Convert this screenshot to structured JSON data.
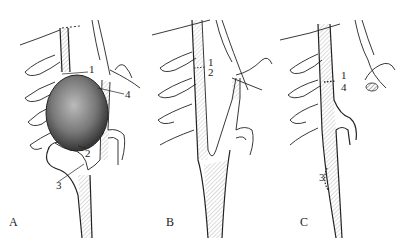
{
  "figure": {
    "panels": [
      {
        "id": "A",
        "label": "A",
        "numbers": [
          "1",
          "4",
          "2",
          "3"
        ]
      },
      {
        "id": "B",
        "label": "B",
        "numbers": [
          "1",
          "2"
        ]
      },
      {
        "id": "C",
        "label": "C",
        "numbers": [
          "1",
          "4",
          "3"
        ]
      }
    ],
    "colors": {
      "ink": "#222222",
      "background": "#ffffff"
    }
  }
}
